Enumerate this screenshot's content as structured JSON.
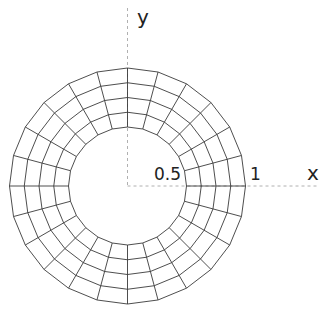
{
  "diagram": {
    "type": "annular-mesh",
    "axes": {
      "x_label": "x",
      "y_label": "y"
    },
    "tick_labels": {
      "inner_radius": "0.5",
      "outer_radius": "1"
    },
    "mesh": {
      "inner_radius": 0.5,
      "outer_radius": 1,
      "radial_divisions": 4,
      "angular_divisions": 24
    },
    "colors": {
      "mesh_line": "#3a3a3a",
      "axis_line": "#b0b0b0",
      "background": "#ffffff"
    }
  }
}
